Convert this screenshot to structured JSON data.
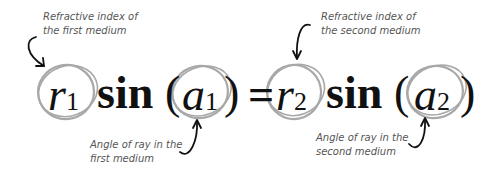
{
  "diagram": {
    "colors": {
      "background": "#ffffff",
      "equation_text": "#111111",
      "annotation_text": "#555555",
      "circle_stroke": "#a8a8a8",
      "arrow_stroke": "#111111"
    },
    "equation": {
      "lhs": {
        "coefficient": {
          "symbol": "r",
          "subscript": "1"
        },
        "function": "sin",
        "open_paren": "(",
        "argument": {
          "symbol": "a",
          "subscript": "1"
        },
        "close_paren": ")"
      },
      "equals": "=",
      "rhs": {
        "coefficient": {
          "symbol": "r",
          "subscript": "2"
        },
        "function": "sin",
        "open_paren": "(",
        "argument": {
          "symbol": "a",
          "subscript": "2"
        },
        "close_paren": ")"
      }
    },
    "annotations": [
      {
        "line1": "Refractive index of",
        "line2": "the first medium",
        "target": "r1",
        "position": "top-left",
        "arrow": "curved-arrow-down-icon"
      },
      {
        "line1": "Refractive index of",
        "line2": "the second medium",
        "target": "r2",
        "position": "top-right",
        "arrow": "curved-arrow-down-icon"
      },
      {
        "line1": "Angle of ray in the",
        "line2": "first medium",
        "target": "a1",
        "position": "bottom-left",
        "arrow": "curved-arrow-up-icon"
      },
      {
        "line1": "Angle of ray in the",
        "line2": "second medium",
        "target": "a2",
        "position": "bottom-right",
        "arrow": "curved-arrow-up-icon"
      }
    ]
  }
}
